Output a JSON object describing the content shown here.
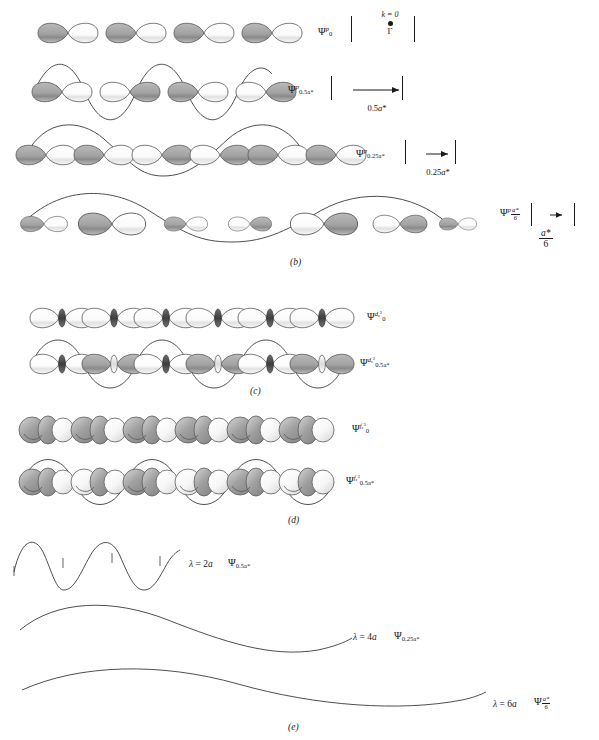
{
  "figure": {
    "caption_panels": [
      "(b)",
      "(c)",
      "(d)",
      "(e)"
    ],
    "panel_b_label": "(b)",
    "panel_c_label": "(c)",
    "panel_d_label": "(d)",
    "panel_e_label": "(e)"
  },
  "kpoint_marker": {
    "k_label": "k = 0",
    "gamma_label": "Γ"
  },
  "rows": [
    {
      "id": "p-row-0",
      "orbital": "p",
      "psi_symbol": "Ψ",
      "psi_superscript": "p",
      "psi_subscript": "0",
      "k_value": "0",
      "k_display": "k = 0",
      "gamma": "Γ",
      "n_orbitals": 4,
      "nodes": 0,
      "envelope": "constant",
      "measure_label": "",
      "description": "four p orbitals all in phase, no envelope wave"
    },
    {
      "id": "p-row-half",
      "orbital": "p",
      "psi_symbol": "Ψ",
      "psi_superscript": "p",
      "psi_subscript": "0.5a*",
      "measure_label": "0.5a*",
      "measure_num": "0.5",
      "measure_unit": "a*",
      "n_orbitals": 4,
      "nodes": 4,
      "envelope": "sine, period = 2 cells",
      "description": "alternating phase p orbitals with sine envelope"
    },
    {
      "id": "p-row-quarter",
      "orbital": "p",
      "psi_symbol": "Ψ",
      "psi_superscript": "p",
      "psi_subscript": "0.25a*",
      "measure_label": "0.25a*",
      "measure_num": "0.25",
      "measure_unit": "a*",
      "n_orbitals": 6,
      "nodes": 3,
      "envelope": "sine, period = 4 cells",
      "description": "p orbitals with longer wavelength sine envelope"
    },
    {
      "id": "p-row-sixth",
      "orbital": "p",
      "psi_symbol": "Ψ",
      "psi_superscript": "p",
      "psi_subscript_num": "a*",
      "psi_subscript_den": "6",
      "measure_num": "a*",
      "measure_den": "6",
      "n_orbitals": 7,
      "nodes": 2,
      "envelope": "sine, period = 6 cells",
      "description": "p orbitals with a*/6 wavevector envelope"
    },
    {
      "id": "d-row-0",
      "orbital": "dz2",
      "psi_symbol": "Ψ",
      "psi_superscript": "d",
      "psi_superscript_sub": "z2",
      "psi_subscript": "0",
      "n_orbitals": 7,
      "nodes": 0,
      "envelope": "constant",
      "description": "dz2 orbitals in phase"
    },
    {
      "id": "d-row-half",
      "orbital": "dz2",
      "psi_symbol": "Ψ",
      "psi_superscript": "d",
      "psi_superscript_sub": "z2",
      "psi_subscript": "0.5a*",
      "n_orbitals": 7,
      "nodes": 7,
      "envelope": "sine, period = 2 cells",
      "description": "dz2 orbitals alternating phase with sine envelope"
    },
    {
      "id": "f-row-0",
      "orbital": "fz3",
      "psi_symbol": "Ψ",
      "psi_superscript": "f",
      "psi_superscript_sub": "z3",
      "psi_subscript": "0",
      "n_orbitals": 7,
      "nodes": 0,
      "envelope": "constant",
      "description": "fz3 orbitals in phase"
    },
    {
      "id": "f-row-half",
      "orbital": "fz3",
      "psi_symbol": "Ψ",
      "psi_superscript": "f",
      "psi_superscript_sub": "z3",
      "psi_subscript": "0.5a*",
      "n_orbitals": 7,
      "nodes": 7,
      "envelope": "sine, period = 2 cells",
      "description": "fz3 orbitals alternating phase with sine envelope"
    }
  ],
  "waves": [
    {
      "id": "wave-2a",
      "lambda_label": "λ = 2a",
      "lambda_symbol": "λ",
      "lambda_value": "2a",
      "psi_symbol": "Ψ",
      "psi_subscript": "0.5a*",
      "wavelength_cells": 2,
      "cycles": 2.5,
      "amplitude": 22,
      "tick_count": 5
    },
    {
      "id": "wave-4a",
      "lambda_label": "λ = 4a",
      "lambda_symbol": "λ",
      "lambda_value": "4a",
      "psi_symbol": "Ψ",
      "psi_subscript": "0.25a*",
      "wavelength_cells": 4,
      "cycles": 1.25,
      "amplitude": 22,
      "tick_count": 0
    },
    {
      "id": "wave-6a",
      "lambda_label": "λ = 6a",
      "lambda_symbol": "λ",
      "lambda_value": "6a",
      "psi_symbol": "Ψ",
      "psi_subscript_num": "a*",
      "psi_subscript_den": "6",
      "wavelength_cells": 6,
      "cycles": 0.85,
      "amplitude": 18,
      "tick_count": 0
    }
  ],
  "colors": {
    "ink": "#1a1a1a",
    "lobe_shaded": "#a8a8a8",
    "lobe_shaded_dark": "#8f8f8f",
    "lobe_empty": "#ffffff",
    "outline": "#5a5a5a",
    "torus_dark": "#4d4d4d",
    "curve": "#3a3a3a"
  }
}
